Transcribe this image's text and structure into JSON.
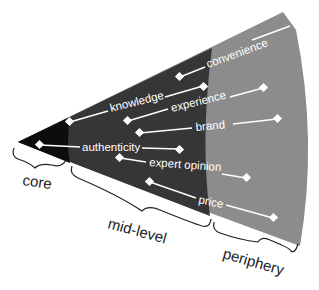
{
  "header": {
    "caption_fragment": "...purchasing drivers..."
  },
  "colors": {
    "core": "#0d0d0d",
    "mid_level": "#363636",
    "periphery": "#8c8c8c",
    "line": "#ffffff",
    "bracket": "#222222"
  },
  "zones": {
    "core": "core",
    "mid_level": "mid-level",
    "periphery": "periphery"
  },
  "labels": {
    "convenience": "convenience",
    "knowledge": "knowledge",
    "experience": "experience",
    "brand": "brand",
    "authenticity": "authenticity",
    "expert_opinion": "expert opinion",
    "price": "price"
  }
}
